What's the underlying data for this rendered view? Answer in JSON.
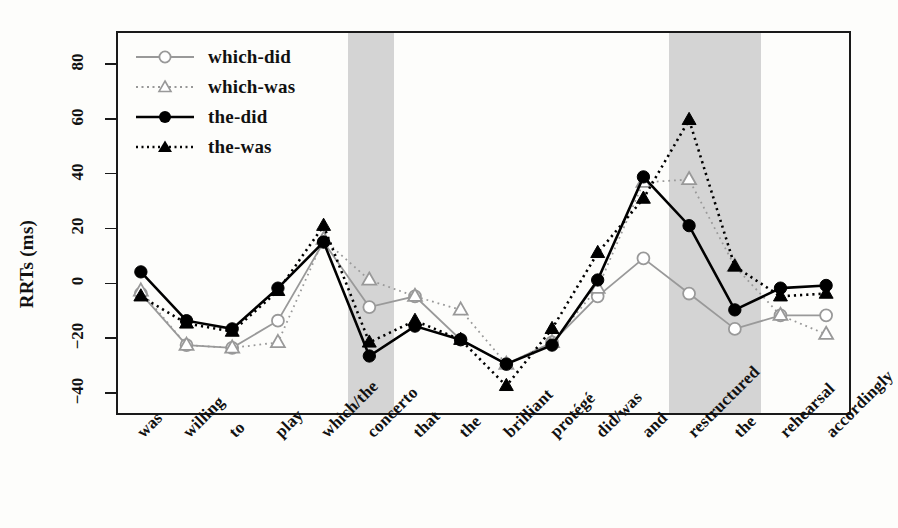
{
  "chart_data": {
    "type": "line",
    "title": "",
    "xlabel": "",
    "ylabel": "RRTs (ms)",
    "ylim": [
      -48,
      92
    ],
    "yticks": [
      -40,
      -20,
      0,
      20,
      40,
      60,
      80
    ],
    "ytick_labels": [
      "-40",
      "-20",
      "0",
      "20",
      "40",
      "60",
      "80"
    ],
    "grid": false,
    "legend_position": "top-left",
    "categories": [
      "was",
      "willing",
      "to",
      "play",
      "which/the",
      "concerto",
      "that",
      "the",
      "brilliant",
      "protégé",
      "did/was",
      "and",
      "restructured",
      "the",
      "rehearsal",
      "accordingly"
    ],
    "highlight_regions": [
      {
        "category": "concerto",
        "color": "#d4d4d4"
      },
      {
        "category": "restructured",
        "color": "#d4d4d4"
      },
      {
        "category": "the",
        "index": 13,
        "color": "#d4d4d4"
      }
    ],
    "series": [
      {
        "name": "which-did",
        "marker": "open-circle",
        "line": "solid",
        "color": "#999999",
        "values": [
          -4,
          -23,
          -24,
          -14,
          15,
          -9,
          -5,
          -21,
          -30,
          -22,
          -5,
          9,
          -4,
          -17,
          -12,
          -12
        ]
      },
      {
        "name": "which-was",
        "marker": "open-triangle",
        "line": "dotted",
        "color": "#999999",
        "values": [
          -3,
          -23,
          -24,
          -22,
          16,
          1,
          -5,
          -10,
          -30,
          -22,
          -2,
          37,
          38,
          6,
          -12,
          -19
        ]
      },
      {
        "name": "the-did",
        "marker": "filled-circle",
        "line": "solid",
        "color": "#000000",
        "values": [
          4,
          -14,
          -17,
          -2,
          15,
          -27,
          -16,
          -21,
          -30,
          -23,
          1,
          39,
          21,
          -10,
          -2,
          -1
        ]
      },
      {
        "name": "the-was",
        "marker": "filled-triangle",
        "line": "dotted",
        "color": "#000000",
        "values": [
          -5,
          -15,
          -18,
          -3,
          21,
          -22,
          -14,
          -21,
          -38,
          -17,
          11,
          31,
          60,
          6,
          -5,
          -4
        ]
      }
    ]
  },
  "legend": {
    "items": [
      {
        "label": "which-did"
      },
      {
        "label": "which-was"
      },
      {
        "label": "the-did"
      },
      {
        "label": "the-was"
      }
    ]
  },
  "axis": {
    "y_title": "RRTs (ms)"
  }
}
